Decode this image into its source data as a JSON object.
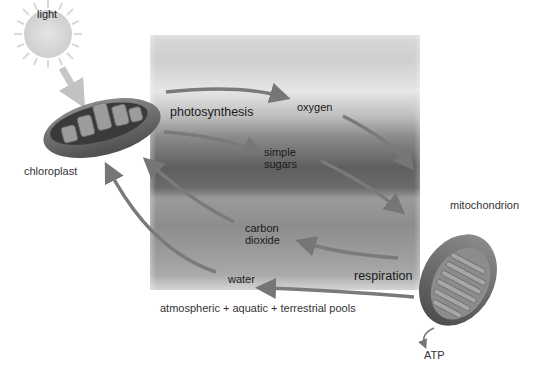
{
  "diagram": {
    "type": "cycle",
    "title": "",
    "nodes": {
      "light": "light",
      "chloroplast": "chloroplast",
      "mitochondrion": "mitochondrion",
      "photosynthesis": "photosynthesis",
      "respiration": "respiration",
      "oxygen": "oxygen",
      "simple_sugars_line1": "simple",
      "simple_sugars_line2": "sugars",
      "carbon_dioxide_line1": "carbon",
      "carbon_dioxide_line2": "dioxide",
      "water": "water",
      "atp": "ATP"
    },
    "caption": "atmospheric + aquatic + terrestrial pools",
    "edges": [
      {
        "from": "light",
        "to": "chloroplast"
      },
      {
        "from": "chloroplast",
        "to": "oxygen",
        "via": "photosynthesis"
      },
      {
        "from": "chloroplast",
        "to": "simple sugars",
        "via": "photosynthesis"
      },
      {
        "from": "oxygen",
        "to": "mitochondrion"
      },
      {
        "from": "simple sugars",
        "to": "mitochondrion"
      },
      {
        "from": "mitochondrion",
        "to": "carbon dioxide",
        "via": "respiration"
      },
      {
        "from": "mitochondrion",
        "to": "water",
        "via": "respiration"
      },
      {
        "from": "carbon dioxide",
        "to": "chloroplast"
      },
      {
        "from": "water",
        "to": "chloroplast"
      },
      {
        "from": "mitochondrion",
        "to": "ATP"
      }
    ],
    "colors": {
      "arrow": "#7a7a7a",
      "light_arrow": "#c4c4c4",
      "sun": "#d9d9d9",
      "organelle_outer": "#6a6a6a",
      "organelle_inner": "#3d3d3d",
      "text": "#1a1a1a"
    }
  }
}
